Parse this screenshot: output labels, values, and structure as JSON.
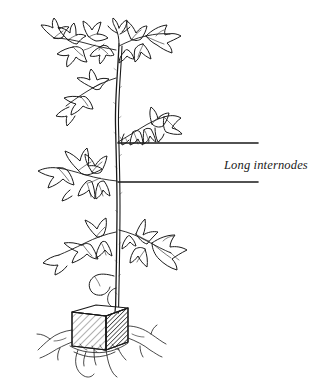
{
  "figure": {
    "type": "botanical-line-drawing",
    "background_color": "#ffffff",
    "ink_color": "#1a1a1a",
    "width": 332,
    "height": 386
  },
  "annotations": {
    "label_text": "Long internodes",
    "label_style": "italic-serif",
    "label_color": "#1a1a1a",
    "leader_lines": [
      {
        "name": "upper-internode-leader",
        "x_start": 118,
        "x_end": 258,
        "y": 143
      },
      {
        "name": "lower-internode-leader",
        "x_start": 118,
        "x_end": 258,
        "y": 182
      }
    ]
  },
  "plant": {
    "stem": {
      "name": "main-stem",
      "top_y": 40,
      "bottom_y": 312,
      "x": 117
    },
    "nodes": [
      {
        "name": "apex-node",
        "y": 46
      },
      {
        "name": "upper-leaf-node",
        "y": 75
      },
      {
        "name": "internode-top-node",
        "y": 143
      },
      {
        "name": "internode-bottom-node",
        "y": 182
      },
      {
        "name": "lower-leaf-node",
        "y": 230
      }
    ],
    "base": {
      "name": "rockwool-cube",
      "x": 72,
      "y": 308,
      "width": 52,
      "height": 38,
      "shading": "diagonal-hatch-front-dark-right-face",
      "roots_visible": true
    }
  }
}
